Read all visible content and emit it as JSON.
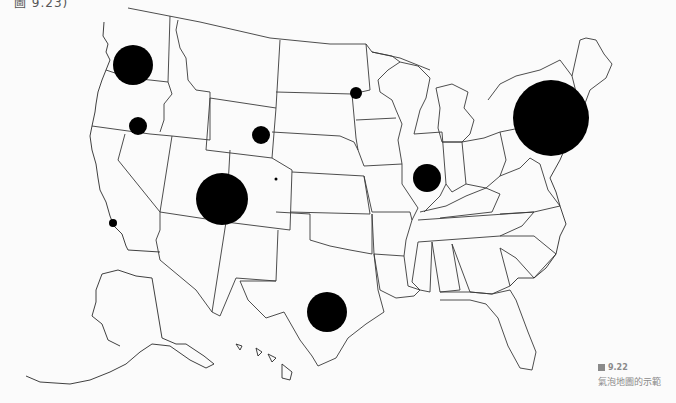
{
  "top_fragment": "圖 9.23)",
  "caption": {
    "figure_number": "9.22",
    "title": "氣泡地圖的示範"
  },
  "colors": {
    "bubble": "#000000",
    "border": "#3a3a3a",
    "background": "#fbfbfb"
  },
  "chart_data": {
    "type": "bubble-map",
    "title": "氣泡地圖的示範",
    "region": "United States (states incl. Alaska & Hawaii inset)",
    "legend": null,
    "bubbles": [
      {
        "location": "Washington (Seattle area)",
        "cx": 133,
        "cy": 65,
        "r": 20
      },
      {
        "location": "Oregon / Idaho border",
        "cx": 138,
        "cy": 126,
        "r": 9
      },
      {
        "location": "Southern California coast",
        "cx": 113,
        "cy": 223,
        "r": 4
      },
      {
        "location": "Utah / Arizona (Four Corners)",
        "cx": 222,
        "cy": 199,
        "r": 26
      },
      {
        "location": "Wyoming",
        "cx": 261,
        "cy": 135,
        "r": 9
      },
      {
        "location": "Colorado",
        "cx": 276,
        "cy": 179,
        "r": 1.5
      },
      {
        "location": "Minnesota",
        "cx": 356,
        "cy": 93,
        "r": 6
      },
      {
        "location": "Illinois / Indiana",
        "cx": 427,
        "cy": 178,
        "r": 14
      },
      {
        "location": "Texas (Austin / San Antonio)",
        "cx": 327,
        "cy": 312,
        "r": 20
      },
      {
        "location": "New York / New Jersey",
        "cx": 551,
        "cy": 118,
        "r": 38
      }
    ]
  }
}
